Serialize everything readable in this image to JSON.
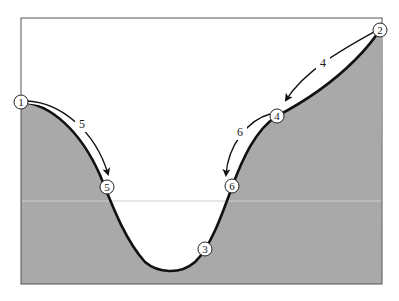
{
  "diagram": {
    "colors": {
      "fill": "#a9a9a9",
      "frame": "#555555",
      "curve": "#111111",
      "background": "#ffffff"
    },
    "nodes": [
      {
        "id": "1",
        "label": "1"
      },
      {
        "id": "2",
        "label": "2"
      },
      {
        "id": "3",
        "label": "3"
      },
      {
        "id": "4",
        "label": "4"
      },
      {
        "id": "5",
        "label": "5"
      },
      {
        "id": "6",
        "label": "6"
      }
    ],
    "moves": [
      {
        "from": "1",
        "to": "5",
        "label": "5"
      },
      {
        "from": "2",
        "to": "4",
        "label": "4"
      },
      {
        "from": "4",
        "to": "6",
        "label": "6"
      }
    ]
  }
}
